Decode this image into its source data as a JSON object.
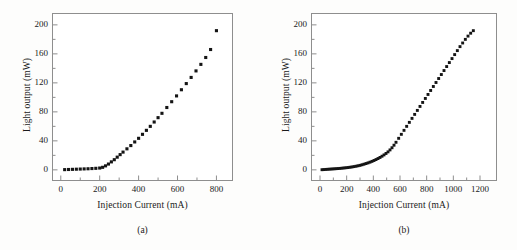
{
  "figure": {
    "background_color": "#fdfdfc",
    "axis_color": "#8e8e8e",
    "marker_color": "#141414",
    "text_color": "#1a1a1a"
  },
  "panels": [
    {
      "id": "a",
      "caption": "(a)",
      "xlabel": "Injection Current (mA)",
      "ylabel": "Light output (mW)",
      "xticks": [
        "0",
        "200",
        "400",
        "600",
        "800"
      ],
      "yticks": [
        "0",
        "40",
        "80",
        "120",
        "160",
        "200"
      ]
    },
    {
      "id": "b",
      "caption": "(b)",
      "xlabel": "Injection Current (mA)",
      "ylabel": "Light output (mW)",
      "xticks": [
        "0",
        "200",
        "400",
        "600",
        "800",
        "1000",
        "1200"
      ],
      "yticks": [
        "0",
        "40",
        "80",
        "120",
        "160",
        "200"
      ]
    }
  ],
  "chart_data": [
    {
      "type": "scatter",
      "panel": "a",
      "title": "(a)",
      "xlabel": "Injection Current (mA)",
      "ylabel": "Light output (mW)",
      "xlim": [
        -40,
        880
      ],
      "ylim": [
        -14,
        215
      ],
      "xticks": [
        0,
        200,
        400,
        600,
        800
      ],
      "yticks": [
        0,
        40,
        80,
        120,
        160,
        200
      ],
      "minor_ticks": true,
      "grid": false,
      "legend": null,
      "marker": "filled-square",
      "threshold_current_mA": 215,
      "x": [
        20,
        40,
        60,
        80,
        100,
        120,
        140,
        160,
        180,
        200,
        215,
        230,
        245,
        260,
        275,
        290,
        305,
        320,
        340,
        360,
        380,
        400,
        420,
        440,
        460,
        480,
        500,
        520,
        545,
        570,
        595,
        620,
        645,
        670,
        695,
        720,
        745,
        770,
        800
      ],
      "y": [
        0.3,
        0.5,
        0.7,
        0.9,
        1.1,
        1.3,
        1.5,
        1.8,
        2.1,
        2.5,
        3.5,
        5.5,
        8.0,
        11.0,
        14.0,
        17.5,
        21.0,
        24.5,
        29.0,
        33.5,
        38.5,
        43.5,
        49.0,
        54.5,
        60.0,
        66.0,
        72.0,
        78.0,
        86.0,
        94.0,
        102.0,
        110.5,
        119.0,
        127.5,
        136.5,
        145.5,
        155.0,
        166.0,
        192.0
      ]
    },
    {
      "type": "scatter",
      "panel": "b",
      "title": "(b)",
      "xlabel": "Injection Current (mA)",
      "ylabel": "Light output (mW)",
      "xlim": [
        -60,
        1320
      ],
      "ylim": [
        -14,
        215
      ],
      "xticks": [
        0,
        200,
        400,
        600,
        800,
        1000,
        1200
      ],
      "yticks": [
        0,
        40,
        80,
        120,
        160,
        200
      ],
      "minor_ticks": true,
      "grid": false,
      "legend": null,
      "marker": "filled-square",
      "threshold_current_mA": 520,
      "x": [
        15,
        30,
        45,
        60,
        75,
        90,
        105,
        120,
        135,
        150,
        165,
        180,
        195,
        210,
        225,
        240,
        255,
        270,
        285,
        300,
        315,
        330,
        345,
        360,
        375,
        390,
        405,
        420,
        435,
        450,
        465,
        480,
        495,
        510,
        525,
        540,
        555,
        570,
        590,
        610,
        630,
        650,
        670,
        690,
        710,
        730,
        750,
        770,
        790,
        810,
        830,
        850,
        870,
        890,
        910,
        930,
        950,
        970,
        990,
        1010,
        1030,
        1050,
        1070,
        1090,
        1110,
        1130,
        1150
      ],
      "y": [
        0.2,
        0.4,
        0.6,
        0.8,
        1.0,
        1.2,
        1.4,
        1.6,
        1.8,
        2.0,
        2.3,
        2.6,
        2.9,
        3.2,
        3.6,
        4.0,
        4.5,
        5.0,
        5.6,
        6.2,
        7.0,
        7.8,
        8.7,
        9.6,
        10.6,
        11.7,
        12.9,
        14.2,
        15.6,
        17.1,
        18.8,
        20.6,
        22.6,
        24.8,
        27.5,
        30.5,
        34.0,
        38.0,
        43.5,
        49.0,
        54.5,
        60.0,
        65.5,
        71.0,
        76.5,
        82.0,
        87.5,
        93.0,
        98.5,
        104.0,
        109.5,
        115.0,
        120.5,
        126.0,
        131.5,
        137.0,
        142.5,
        148.0,
        153.5,
        159.0,
        164.5,
        170.0,
        175.0,
        180.0,
        184.5,
        188.5,
        192.0
      ]
    }
  ]
}
